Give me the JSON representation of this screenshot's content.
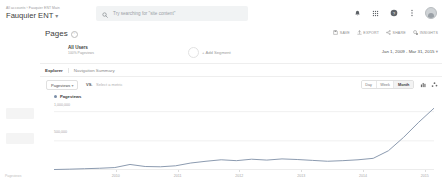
{
  "header": {
    "breadcrumb": "All accounts  ›  Fauquier ENT Main",
    "account_name": "Fauquier ENT",
    "account_caret": "▾",
    "search_placeholder": "Try searching for \"site content\"",
    "search_icon": "search-icon",
    "icons": [
      {
        "name": "notifications-icon",
        "glyph": "●"
      },
      {
        "name": "apps-grid-icon",
        "glyph": "∷"
      },
      {
        "name": "help-icon",
        "glyph": "?"
      },
      {
        "name": "more-vert-icon",
        "glyph": "⋮"
      }
    ],
    "avatar_name": "user-avatar"
  },
  "sidebar": {
    "footer_label": "Pageviews"
  },
  "main": {
    "page_title": "Pages",
    "info_glyph": "i",
    "actions": [
      {
        "name": "save-button",
        "label": "SAVE",
        "icon": "save-icon"
      },
      {
        "name": "export-button",
        "label": "EXPORT",
        "icon": "export-icon"
      },
      {
        "name": "share-button",
        "label": "SHARE",
        "icon": "share-icon"
      },
      {
        "name": "insights-button",
        "label": "INSIGHTS",
        "icon": "insights-icon"
      }
    ],
    "segment": {
      "title": "All Users",
      "subtitle": "100% Pageviews",
      "add_label": "+ Add Segment"
    },
    "date_range": "Jan 1, 2009 - Mar 31, 2015",
    "date_caret": "▾",
    "tabs": [
      {
        "label": "Explorer",
        "selected": true
      },
      {
        "label": "Navigation Summary",
        "selected": false
      }
    ],
    "metric": {
      "primary": "Pageviews",
      "primary_caret": "▾",
      "vs": "VS.",
      "secondary_placeholder": "Select a metric"
    },
    "granularity": [
      {
        "label": "Day",
        "selected": false
      },
      {
        "label": "Week",
        "selected": false
      },
      {
        "label": "Month",
        "selected": true
      }
    ],
    "chart_types": [
      {
        "name": "bar-chart-icon"
      },
      {
        "name": "scatter-chart-icon"
      }
    ]
  },
  "chart_data": {
    "type": "line",
    "title": "Pageviews",
    "xlabel": "",
    "ylabel": "Pageviews",
    "ylim": [
      0,
      1200000
    ],
    "grid": true,
    "legend": "Pageviews",
    "legend_position": "top-left",
    "ytick_labels": [
      "1,000,000",
      "500,000"
    ],
    "yticks": [
      1000000,
      500000
    ],
    "xtick_labels": [
      "2010",
      "2011",
      "2012",
      "2013",
      "2014",
      "2015"
    ],
    "line_color": "#8c9bb0",
    "series": [
      {
        "name": "Pageviews",
        "x": [
          "2009-01",
          "2009-04",
          "2009-07",
          "2009-10",
          "2010-01",
          "2010-04",
          "2010-07",
          "2010-10",
          "2011-01",
          "2011-04",
          "2011-07",
          "2011-10",
          "2012-01",
          "2012-04",
          "2012-07",
          "2012-10",
          "2013-01",
          "2013-04",
          "2013-07",
          "2013-10",
          "2014-01",
          "2014-04",
          "2014-07",
          "2014-10",
          "2015-01",
          "2015-03"
        ],
        "values": [
          8000,
          14000,
          22000,
          30000,
          42000,
          95000,
          60000,
          55000,
          72000,
          120000,
          150000,
          175000,
          160000,
          185000,
          170000,
          190000,
          180000,
          165000,
          150000,
          160000,
          175000,
          200000,
          330000,
          560000,
          820000,
          1060000
        ]
      }
    ]
  }
}
